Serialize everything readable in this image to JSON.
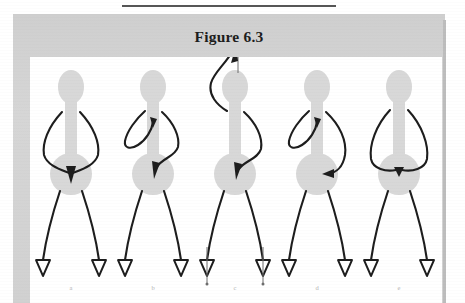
{
  "document": {
    "rule_present": true,
    "figure_title": "Figure 6.3"
  },
  "colors": {
    "plate_gray": "#d2d2d2",
    "panel_white": "#ffffff",
    "body_gray": "#d6d6d6",
    "ink_black": "#1d1d1d",
    "label_gray": "#b4b4b4",
    "rule_gray": "#565656"
  },
  "panel": {
    "figures": [
      {
        "id": "figure-a",
        "label": "a",
        "description": "stick figure with both arms curving down and inward, meeting at the waist where a downward arrowhead points into the hip circle",
        "arrow_count": 1,
        "arrow_direction": "down-into-waist",
        "above_head_arrow": false,
        "below_feet_marks": false
      },
      {
        "id": "figure-b",
        "label": "b",
        "description": "stick figure with left arm looped outward ending in a small hook arrowhead near the shoulder, right arm curving down across the torso into the waist with a downward arrowhead",
        "arrow_count": 2,
        "arrow_direction": "loop-up-and-down-into-waist",
        "above_head_arrow": false,
        "below_feet_marks": false
      },
      {
        "id": "figure-c",
        "label": "c",
        "description": "stick figure with a long curve rising from above the head ending in an upward arrowhead on a vertical axis line, right arm curving down the torso into the waist with a downward arrowhead, and vertical tick lines with dots beneath both feet",
        "arrow_count": 2,
        "arrow_direction": "up-above-head-and-down-into-waist",
        "above_head_arrow": true,
        "below_feet_marks": true
      },
      {
        "id": "figure-d",
        "label": "d",
        "description": "stick figure with left arm looped outward ending in a small hook arrowhead near the shoulder, right arm curving down to the right hip ending in a small arrowhead pointing left into the hip",
        "arrow_count": 2,
        "arrow_direction": "loop-up-and-into-right-hip",
        "above_head_arrow": false,
        "below_feet_marks": false
      },
      {
        "id": "figure-e",
        "label": "e",
        "description": "stick figure with both arms bowed widely outward and meeting at the waist with a small downward arrowhead",
        "arrow_count": 1,
        "arrow_direction": "down-into-waist",
        "above_head_arrow": false,
        "below_feet_marks": false
      }
    ]
  }
}
